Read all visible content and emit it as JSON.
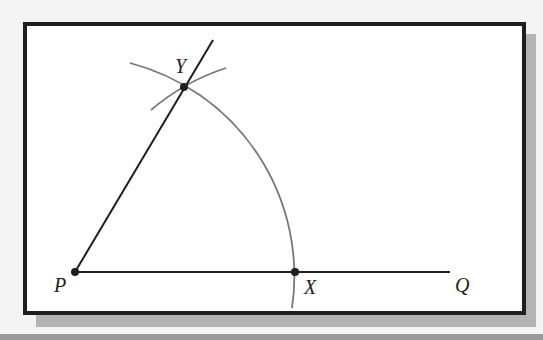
{
  "figure": {
    "type": "compass-and-straightedge construction",
    "points": [
      {
        "id": "P",
        "label": "P",
        "x": 75,
        "y": 272
      },
      {
        "id": "X",
        "label": "X",
        "x": 295,
        "y": 272
      },
      {
        "id": "Y",
        "label": "Y",
        "x": 184,
        "y": 87
      },
      {
        "id": "Q",
        "label": "Q",
        "x": 450,
        "y": 272
      }
    ],
    "segments": [
      {
        "from": "P",
        "to": "Q",
        "name": "ray PQ"
      },
      {
        "from": "P",
        "through": "Y",
        "name": "ray PY"
      }
    ],
    "arcs": [
      {
        "center": "P",
        "radius": "PX",
        "name": "arc through X and Y"
      },
      {
        "center": "X",
        "radius": "PX",
        "name": "arc intersecting at Y"
      }
    ]
  },
  "labels": {
    "P": "P",
    "X": "X",
    "Y": "Y",
    "Q": "Q"
  },
  "colors": {
    "line": "#1e1e1e",
    "arc": "#777777",
    "frame_border": "#1e1e1e",
    "shadow": "#b4b4b4",
    "background": "#f4f4f4"
  }
}
